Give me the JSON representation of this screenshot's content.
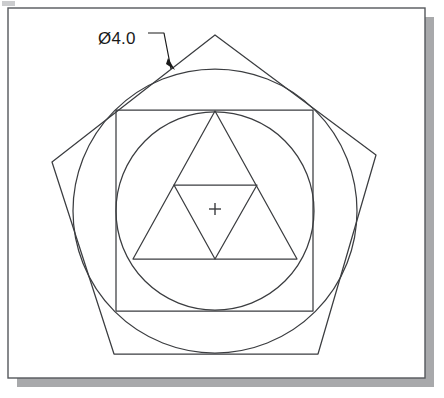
{
  "canvas": {
    "width": 444,
    "height": 398,
    "background": "#ffffff"
  },
  "sheet": {
    "name": "drawing-sheet",
    "x": 8,
    "y": 8,
    "width": 417,
    "height": 370,
    "fill": "#ffffff",
    "border_color": "#55585c",
    "border_width": 1.4,
    "shadow_color": "#a8a9ab",
    "shadow_offset": 9
  },
  "artifact": {
    "name": "scan-artifact",
    "x": 2,
    "y": 1,
    "width": 13,
    "height": 5,
    "color": "#b9bbbd"
  },
  "annotation": {
    "dimension_label": "Ø4.0",
    "label_x": 98,
    "label_y": 44,
    "leader": {
      "name": "leader-line",
      "horizontal_start_x": 148,
      "horizontal_end_x": 164,
      "horizontal_y": 33,
      "elbow_x": 164,
      "elbow_y": 33,
      "tip_x": 171,
      "tip_y": 69
    },
    "arrowhead": {
      "name": "leader-arrowhead",
      "points": "168,58 175,70 166,64",
      "fill": "#1a1a1a"
    }
  },
  "geometry": {
    "stroke_color": "#3b3d40",
    "stroke_width": 1.25,
    "center": {
      "x": 215,
      "y": 209
    },
    "pentagon": {
      "name": "outer-pentagon",
      "label": "circumscribed pentagon",
      "points": "215,35 376,155 318,354 114,354 52,162"
    },
    "outer_circle": {
      "name": "outer-circle",
      "label": "Ø4.0 reference circle",
      "cx": 215,
      "cy": 211,
      "r": 142,
      "diameter_value": "4.0"
    },
    "square": {
      "name": "inscribed-square",
      "x": 116,
      "y": 110,
      "width": 197,
      "height": 201
    },
    "inner_circle": {
      "name": "inner-circle",
      "cx": 215,
      "cy": 211,
      "r": 99
    },
    "large_triangle": {
      "name": "inscribed-triangle",
      "points": "215,111 297,259 133,259"
    },
    "medial_triangle": {
      "name": "medial-triangle",
      "points": "174,185 257,185 215,259"
    },
    "center_mark": {
      "name": "center-mark",
      "cx": 215,
      "cy": 209,
      "arm": 6,
      "stroke_width": 1.4
    }
  }
}
